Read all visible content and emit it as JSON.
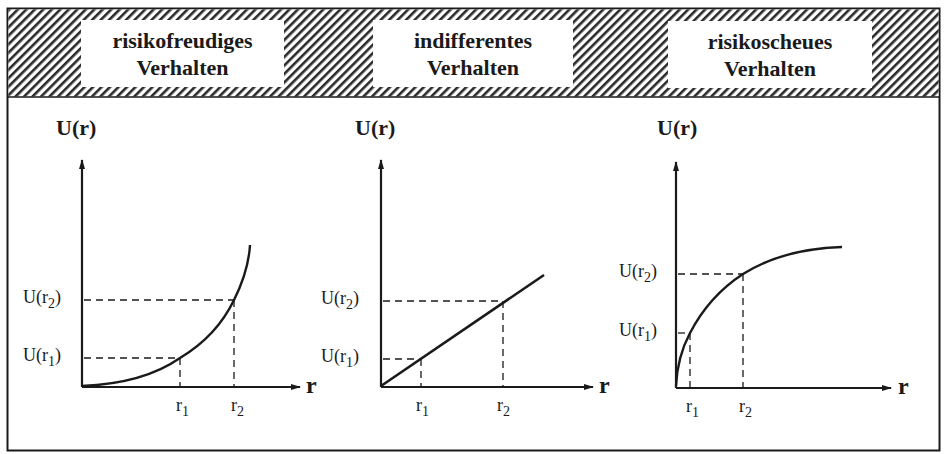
{
  "panels": [
    {
      "title_line1": "risikofreudiges",
      "title_line2": "Verhalten",
      "y_axis_label": "U(r)",
      "x_axis_label": "r",
      "y_ticks": [
        {
          "base": "U(r",
          "sub": "2",
          "close": ")"
        },
        {
          "base": "U(r",
          "sub": "1",
          "close": ")"
        }
      ],
      "x_ticks": [
        {
          "base": "r",
          "sub": "1"
        },
        {
          "base": "r",
          "sub": "2"
        }
      ]
    },
    {
      "title_line1": "indifferentes",
      "title_line2": "Verhalten",
      "y_axis_label": "U(r)",
      "x_axis_label": "r",
      "y_ticks": [
        {
          "base": "U(r",
          "sub": "2",
          "close": ")"
        },
        {
          "base": "U(r",
          "sub": "1",
          "close": ")"
        }
      ],
      "x_ticks": [
        {
          "base": "r",
          "sub": "1"
        },
        {
          "base": "r",
          "sub": "2"
        }
      ]
    },
    {
      "title_line1": "risikoscheues",
      "title_line2": "Verhalten",
      "y_axis_label": "U(r)",
      "x_axis_label": "r",
      "y_ticks": [
        {
          "base": "U(r",
          "sub": "2",
          "close": ")"
        },
        {
          "base": "U(r",
          "sub": "1",
          "close": ")"
        }
      ],
      "x_ticks": [
        {
          "base": "r",
          "sub": "1"
        },
        {
          "base": "r",
          "sub": "2"
        }
      ]
    }
  ],
  "colors": {
    "ink": "#1a1a1a",
    "background": "#ffffff"
  }
}
